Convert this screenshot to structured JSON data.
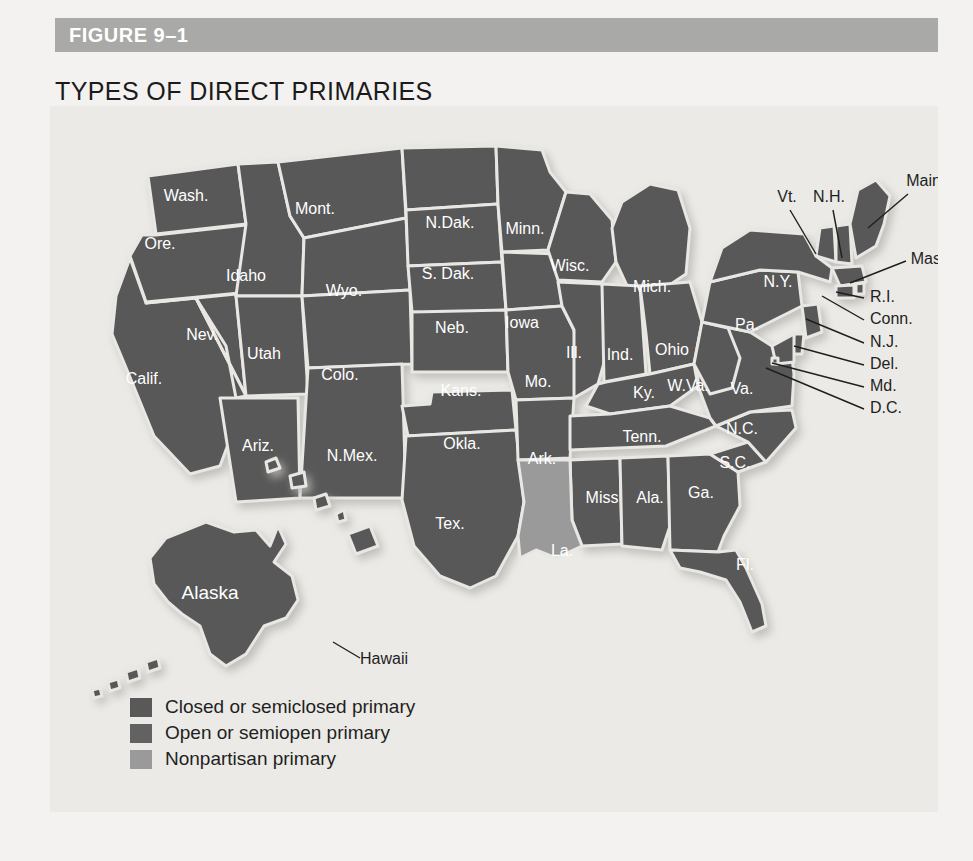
{
  "figure": {
    "number": "FIGURE 9–1",
    "title": "TYPES OF DIRECT PRIMARIES",
    "bar_color": "#a9a9a7",
    "panel_color": "#ebeae6"
  },
  "legend": {
    "items": [
      {
        "label": "Closed or semiclosed primary",
        "color": "#595959"
      },
      {
        "label": "Open or semiopen primary",
        "color": "#626262"
      },
      {
        "label": "Nonpartisan primary",
        "color": "#9a9a9a"
      }
    ]
  },
  "map": {
    "land_closed_color": "#595959",
    "land_open_color": "#626262",
    "land_nonpartisan_color": "#9a9a9a",
    "border_color": "#e8e7e3",
    "inside_label_color": "#ffffff",
    "outside_label_color": "#1f1f1f",
    "leader_color": "#1f1f1f",
    "inside_labels": [
      {
        "name": "Wash.",
        "x": 136,
        "y": 95
      },
      {
        "name": "Mont.",
        "x": 265,
        "y": 108
      },
      {
        "name": "N.Dak.",
        "x": 400,
        "y": 122
      },
      {
        "name": "Minn.",
        "x": 475,
        "y": 128
      },
      {
        "name": "Ore.",
        "x": 110,
        "y": 143
      },
      {
        "name": "Idaho",
        "x": 196,
        "y": 175
      },
      {
        "name": "S. Dak.",
        "x": 398,
        "y": 173
      },
      {
        "name": "Wisc.",
        "x": 520,
        "y": 165
      },
      {
        "name": "Mich.",
        "x": 602,
        "y": 186
      },
      {
        "name": "N.Y.",
        "x": 728,
        "y": 181
      },
      {
        "name": "Wyo.",
        "x": 294,
        "y": 190
      },
      {
        "name": "Neb.",
        "x": 402,
        "y": 227
      },
      {
        "name": "Iowa",
        "x": 472,
        "y": 222
      },
      {
        "name": "Pa.",
        "x": 697,
        "y": 224
      },
      {
        "name": "Nev.",
        "x": 152,
        "y": 234
      },
      {
        "name": "Utah",
        "x": 214,
        "y": 253
      },
      {
        "name": "Ill.",
        "x": 524,
        "y": 252
      },
      {
        "name": "Ind.",
        "x": 570,
        "y": 254
      },
      {
        "name": "Ohio",
        "x": 622,
        "y": 249
      },
      {
        "name": "Calif.",
        "x": 94,
        "y": 278
      },
      {
        "name": "Colo.",
        "x": 290,
        "y": 274
      },
      {
        "name": "Kans.",
        "x": 411,
        "y": 290
      },
      {
        "name": "Mo.",
        "x": 488,
        "y": 281
      },
      {
        "name": "W.Va.",
        "x": 638,
        "y": 285
      },
      {
        "name": "Va.",
        "x": 692,
        "y": 288
      },
      {
        "name": "Ky.",
        "x": 594,
        "y": 292
      },
      {
        "name": "Ariz.",
        "x": 208,
        "y": 345
      },
      {
        "name": "N.Mex.",
        "x": 302,
        "y": 355
      },
      {
        "name": "Okla.",
        "x": 412,
        "y": 343
      },
      {
        "name": "Ark.",
        "x": 492,
        "y": 358
      },
      {
        "name": "Tenn.",
        "x": 592,
        "y": 336
      },
      {
        "name": "N.C.",
        "x": 692,
        "y": 328
      },
      {
        "name": "S.C.",
        "x": 685,
        "y": 362
      },
      {
        "name": "Miss",
        "x": 552,
        "y": 397
      },
      {
        "name": "Ala.",
        "x": 600,
        "y": 397
      },
      {
        "name": "Ga.",
        "x": 651,
        "y": 392
      },
      {
        "name": "Tex.",
        "x": 400,
        "y": 423
      },
      {
        "name": "La.",
        "x": 512,
        "y": 450
      },
      {
        "name": "Fl.",
        "x": 695,
        "y": 464
      },
      {
        "name": "Alaska",
        "x": 160,
        "y": 493
      }
    ],
    "outside_labels": [
      {
        "name": "Vt.",
        "x": 737,
        "y": 96,
        "anchor": "middle"
      },
      {
        "name": "N.H.",
        "x": 779,
        "y": 96,
        "anchor": "middle"
      },
      {
        "name": "Maine",
        "x": 878,
        "y": 80,
        "anchor": "middle"
      },
      {
        "name": "Mass.",
        "x": 882,
        "y": 158,
        "anchor": "middle"
      },
      {
        "name": "R.I.",
        "x": 820,
        "y": 196,
        "anchor": "start"
      },
      {
        "name": "Conn.",
        "x": 820,
        "y": 218,
        "anchor": "start"
      },
      {
        "name": "N.J.",
        "x": 820,
        "y": 241,
        "anchor": "start"
      },
      {
        "name": "Del.",
        "x": 820,
        "y": 263,
        "anchor": "start"
      },
      {
        "name": "Md.",
        "x": 820,
        "y": 285,
        "anchor": "start"
      },
      {
        "name": "D.C.",
        "x": 820,
        "y": 307,
        "anchor": "start"
      },
      {
        "name": "Hawaii",
        "x": 334,
        "y": 558,
        "anchor": "middle"
      }
    ],
    "leader_lines": [
      {
        "to": "Vt.",
        "x1": 740,
        "y1": 104,
        "x2": 766,
        "y2": 148
      },
      {
        "to": "N.H.",
        "x1": 783,
        "y1": 104,
        "x2": 792,
        "y2": 152
      },
      {
        "to": "Maine",
        "x1": 858,
        "y1": 88,
        "x2": 818,
        "y2": 122
      },
      {
        "to": "Mass.",
        "x1": 856,
        "y1": 155,
        "x2": 800,
        "y2": 177
      },
      {
        "to": "R.I.",
        "x1": 814,
        "y1": 192,
        "x2": 786,
        "y2": 186
      },
      {
        "to": "Conn.",
        "x1": 814,
        "y1": 214,
        "x2": 772,
        "y2": 190
      },
      {
        "to": "N.J.",
        "x1": 814,
        "y1": 237,
        "x2": 756,
        "y2": 213
      },
      {
        "to": "Del.",
        "x1": 814,
        "y1": 259,
        "x2": 744,
        "y2": 240
      },
      {
        "to": "Md.",
        "x1": 814,
        "y1": 281,
        "x2": 722,
        "y2": 257
      },
      {
        "to": "D.C.",
        "x1": 814,
        "y1": 303,
        "x2": 716,
        "y2": 262
      },
      {
        "to": "Hawaii",
        "x1": 310,
        "y1": 552,
        "x2": 283,
        "y2": 536
      }
    ]
  }
}
